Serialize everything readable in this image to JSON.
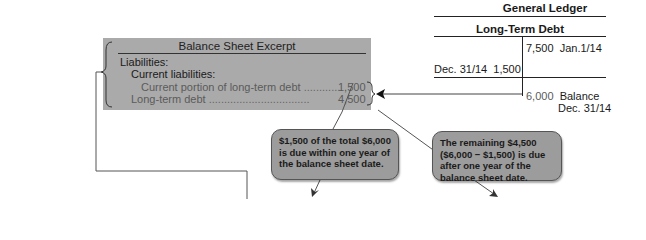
{
  "balance_sheet": {
    "title": "Balance Sheet Excerpt",
    "liabilities_label": "Liabilities:",
    "current_liabilities_label": "Current liabilities:",
    "rows": [
      {
        "label": "Current portion of long-term debt",
        "dots": "............",
        "value": "1,500"
      },
      {
        "label": "Long-term debt",
        "dots": ".................................",
        "value": "4,500"
      }
    ]
  },
  "general_ledger": {
    "title": "General Ledger",
    "account": "Long-Term Debt",
    "credit_entry": {
      "amount": "7,500",
      "date": "Jan.1/14"
    },
    "debit_entry": {
      "date": "Dec. 31/14",
      "amount": "1,500"
    },
    "balance": {
      "amount": "6,000",
      "label": "Balance",
      "date": "Dec. 31/14"
    }
  },
  "callouts": [
    {
      "text": "$1,500 of the total $6,000 is due within one year of the balance sheet date."
    },
    {
      "text": "The remaining $4,500 ($6,000 − $1,500) is due after one year of the balance sheet date."
    }
  ],
  "colors": {
    "box_fill": "#aaaaaa",
    "callout_fill": "#9c9c9c",
    "line": "#555555"
  }
}
